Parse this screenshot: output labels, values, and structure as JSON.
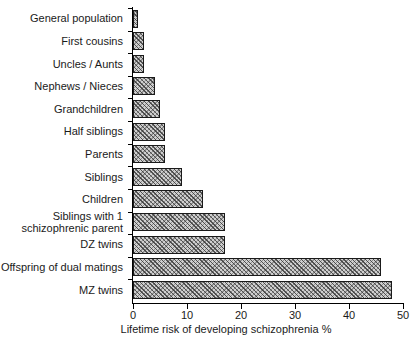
{
  "chart_data": {
    "type": "bar",
    "orientation": "horizontal",
    "title": "",
    "xlabel": "Lifetime risk of developing schizophrenia %",
    "ylabel": "",
    "xlim": [
      0,
      50
    ],
    "xticks": [
      0,
      10,
      20,
      30,
      40,
      50
    ],
    "xtick_labels": [
      "0",
      "10",
      "20",
      "30",
      "40",
      "50"
    ],
    "grid": false,
    "legend": false,
    "categories": [
      "General population",
      "First cousins",
      "Uncles / Aunts",
      "Nephews / Nieces",
      "Grandchildren",
      "Half siblings",
      "Parents",
      "Siblings",
      "Children",
      "Siblings with 1\nschizophrenic parent",
      "DZ twins",
      "Offspring of dual matings",
      "MZ twins"
    ],
    "values": [
      1,
      2,
      2,
      4,
      5,
      6,
      6,
      9,
      13,
      17,
      17,
      46,
      48
    ],
    "series": [
      {
        "name": "Lifetime risk of developing schizophrenia %",
        "values": [
          1,
          2,
          2,
          4,
          5,
          6,
          6,
          9,
          13,
          17,
          17,
          46,
          48
        ]
      }
    ],
    "bar_style": {
      "fill": "#cfcfcf",
      "hatch": "crosshatch",
      "edge_color": "#1a1a1a"
    }
  },
  "axes": {
    "x_axis_label": "Lifetime risk of developing schizophrenia %"
  }
}
